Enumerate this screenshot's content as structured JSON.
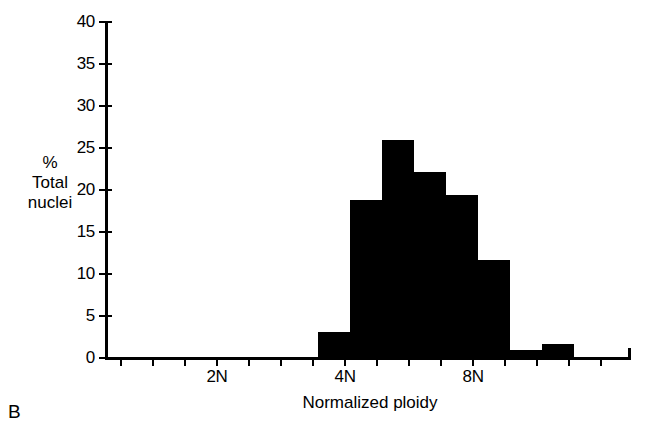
{
  "figure": {
    "panel_label": "B"
  },
  "chart_data": {
    "type": "bar",
    "title": "",
    "subtitle": "",
    "xlabel": "Normalized ploidy",
    "ylabel": "% Total nuclei",
    "ylabel_lines": [
      "%",
      "Total",
      "nuclei"
    ],
    "grid": false,
    "legend": null,
    "ylim": [
      0,
      40
    ],
    "yticks": [
      0,
      5,
      10,
      15,
      20,
      25,
      30,
      35,
      40
    ],
    "ytick_labels": [
      "0",
      "5",
      "10",
      "15",
      "20",
      "25",
      "30",
      "35",
      "40"
    ],
    "xlim": [
      0.5,
      16.9
    ],
    "xtick_values": [
      1,
      2,
      3,
      4,
      5,
      6,
      7,
      8,
      9,
      10,
      11,
      12,
      13,
      14,
      15,
      16
    ],
    "xtick_labels": [
      "",
      "",
      "",
      "2N",
      "",
      "",
      "",
      "4N",
      "",
      "",
      "",
      "8N",
      "",
      "",
      "",
      ""
    ],
    "labeled_ticks": [
      {
        "value": 4,
        "label": "2N"
      },
      {
        "value": 8,
        "label": "4N"
      },
      {
        "value": 12,
        "label": "8N"
      }
    ],
    "bin_width": 1,
    "categories": [
      "3.5N-4N",
      "4N-4.5N",
      "4.5N-5N",
      "5N-5.5N",
      "5.5N-6N",
      "6N-7N",
      "7N-8N",
      "8N-9N"
    ],
    "bars": [
      {
        "x_start": 7.15,
        "x_end": 8.15,
        "value": 3.1
      },
      {
        "x_start": 8.15,
        "x_end": 9.15,
        "value": 18.8
      },
      {
        "x_start": 9.15,
        "x_end": 10.15,
        "value": 26.0
      },
      {
        "x_start": 10.15,
        "x_end": 11.15,
        "value": 22.1
      },
      {
        "x_start": 11.15,
        "x_end": 12.15,
        "value": 19.4
      },
      {
        "x_start": 12.15,
        "x_end": 13.15,
        "value": 11.7
      },
      {
        "x_start": 13.15,
        "x_end": 14.15,
        "value": 1.0
      },
      {
        "x_start": 14.15,
        "x_end": 15.15,
        "value": 1.7
      }
    ],
    "values": [
      3.1,
      18.8,
      26.0,
      22.1,
      19.4,
      11.7,
      1.0,
      1.7
    ],
    "bar_color": "#000000",
    "axis_color": "#000000"
  }
}
